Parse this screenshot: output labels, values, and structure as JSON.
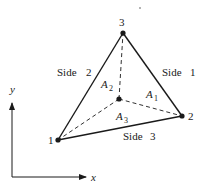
{
  "diagram": {
    "type": "triangle-area-coordinates",
    "colors": {
      "stroke": "#1a1a1a",
      "background": "#ffffff"
    },
    "vertices": [
      {
        "id": "1",
        "label": "1",
        "x": 58,
        "y": 140
      },
      {
        "id": "2",
        "label": "2",
        "x": 182,
        "y": 116
      },
      {
        "id": "3",
        "label": "3",
        "x": 123,
        "y": 33
      }
    ],
    "interior_point": {
      "x": 119,
      "y": 99
    },
    "sides": [
      {
        "id": "side-1",
        "label": "Side",
        "number": "1"
      },
      {
        "id": "side-2",
        "label": "Side",
        "number": "2"
      },
      {
        "id": "side-3",
        "label": "Side",
        "number": "3"
      }
    ],
    "areas": [
      {
        "id": "A1",
        "base": "A",
        "sub": "1"
      },
      {
        "id": "A2",
        "base": "A",
        "sub": "2"
      },
      {
        "id": "A3",
        "base": "A",
        "sub": "3"
      }
    ],
    "axes": {
      "x_label": "x",
      "y_label": "y"
    }
  }
}
